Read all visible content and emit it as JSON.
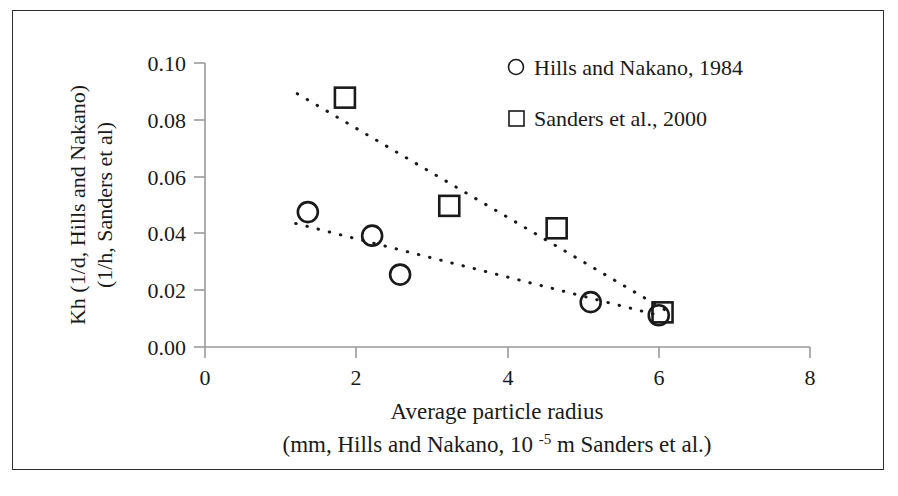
{
  "chart_data": {
    "type": "scatter",
    "title": "",
    "xlabel": "Average particle radius (mm, Hills and Nakano, 10 -5 m Sanders et al.)",
    "xlabel_line1": "Average particle radius",
    "xlabel_line2_pre": "(mm, Hills and Nakano, 10 ",
    "xlabel_line2_sup": "-5",
    "xlabel_line2_post": " m Sanders et al.)",
    "ylabel": "Kh (1/d, Hills and Nakano) (1/h, Sanders et al)",
    "ylabel_line1": "Kh (1/d, Hills and Nakano)",
    "ylabel_line2": "(1/h, Sanders et al)",
    "xlim": [
      0,
      8
    ],
    "ylim": [
      0,
      0.1
    ],
    "xticks": [
      "0",
      "2",
      "4",
      "6",
      "8"
    ],
    "xtick_values": [
      0,
      2,
      4,
      6,
      8
    ],
    "yticks": [
      "0.00",
      "0.02",
      "0.04",
      "0.06",
      "0.08",
      "0.10"
    ],
    "ytick_values": [
      0,
      0.02,
      0.04,
      0.06,
      0.08,
      0.1
    ],
    "grid": false,
    "legend_position": "top-right",
    "series": [
      {
        "name": "Hills and Nakano, 1984",
        "marker": "circle",
        "color": "#1a1a1a",
        "x": [
          1.36,
          2.21,
          2.58,
          5.1,
          6.0
        ],
        "y": [
          0.0475,
          0.0392,
          0.0255,
          0.0158,
          0.0112
        ],
        "trendline": {
          "style": "dotted",
          "x1": 1.2,
          "y1": 0.0435,
          "x2": 6.05,
          "y2": 0.0108
        }
      },
      {
        "name": "Sanders et al., 2000",
        "marker": "square",
        "color": "#1a1a1a",
        "x": [
          1.85,
          3.23,
          4.65,
          6.05
        ],
        "y": [
          0.0878,
          0.0497,
          0.0418,
          0.0122
        ],
        "trendline": {
          "style": "dotted",
          "x1": 1.22,
          "y1": 0.0892,
          "x2": 6.1,
          "y2": 0.0128
        }
      }
    ]
  },
  "legend": {
    "items": [
      {
        "label": "Hills and Nakano, 1984",
        "marker": "circle"
      },
      {
        "label": "Sanders et al., 2000",
        "marker": "square"
      }
    ]
  },
  "axes": {
    "y_labels": [
      "0.10",
      "0.08",
      "0.06",
      "0.04",
      "0.02",
      "0.00"
    ],
    "x_labels": [
      "0",
      "2",
      "4",
      "6",
      "8"
    ]
  }
}
